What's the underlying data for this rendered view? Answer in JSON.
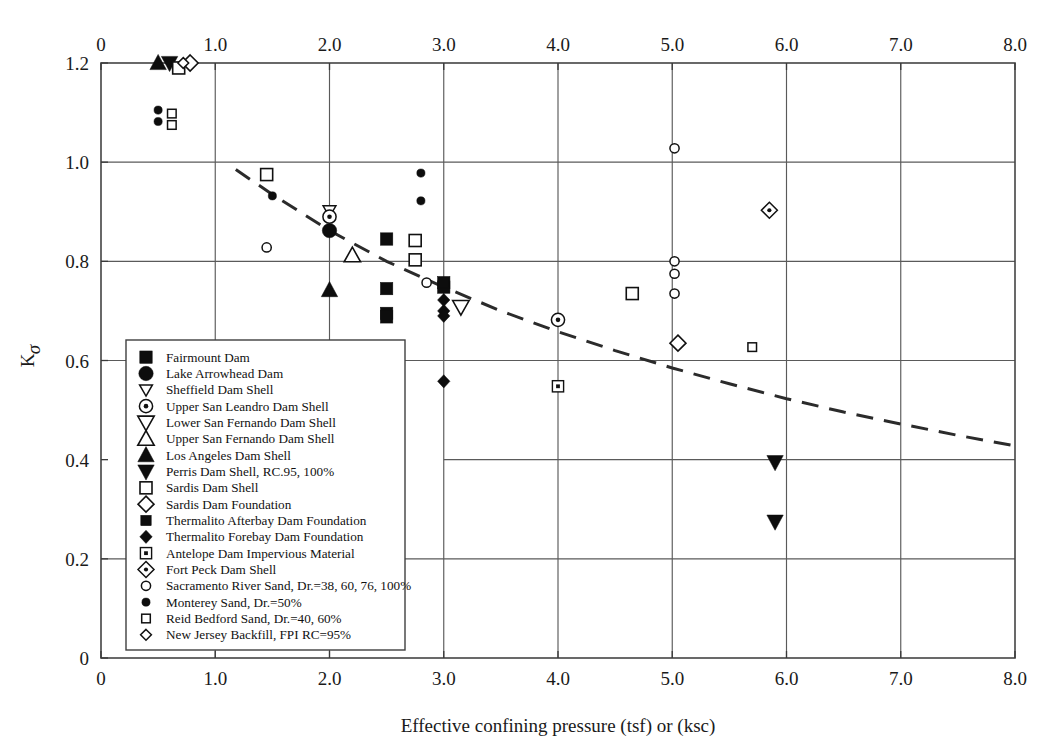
{
  "chart_data": {
    "type": "scatter",
    "title": "",
    "xlabel": "Effective confining pressure (tsf) or (ksc)",
    "ylabel": "Kσ",
    "ylabel_base": "K",
    "ylabel_sub": "σ",
    "xlim": [
      0,
      8.0
    ],
    "ylim": [
      0,
      1.2
    ],
    "xticks": [
      "0",
      "1.0",
      "2.0",
      "3.0",
      "4.0",
      "5.0",
      "6.0",
      "7.0",
      "8.0"
    ],
    "xtick_values": [
      0,
      1.0,
      2.0,
      3.0,
      4.0,
      5.0,
      6.0,
      7.0,
      8.0
    ],
    "yticks": [
      "0",
      "0.2",
      "0.4",
      "0.6",
      "0.8",
      "1.0",
      "1.2"
    ],
    "ytick_values": [
      0,
      0.2,
      0.4,
      0.6,
      0.8,
      1.0,
      1.2
    ],
    "grid": true,
    "top_axis": true,
    "legend_position": "lower-left-inside",
    "trendline": {
      "name": "Recommended K-sigma curve",
      "style": "dashed",
      "color": "#2b2b2b",
      "points": [
        [
          1.18,
          0.985
        ],
        [
          1.5,
          0.935
        ],
        [
          2.0,
          0.862
        ],
        [
          2.5,
          0.8
        ],
        [
          3.0,
          0.748
        ],
        [
          3.5,
          0.7
        ],
        [
          4.0,
          0.658
        ],
        [
          4.5,
          0.62
        ],
        [
          5.0,
          0.585
        ],
        [
          5.5,
          0.553
        ],
        [
          6.0,
          0.523
        ],
        [
          6.5,
          0.496
        ],
        [
          7.0,
          0.472
        ],
        [
          7.5,
          0.449
        ],
        [
          8.0,
          0.428
        ]
      ]
    },
    "series": [
      {
        "name": "Fairmount Dam",
        "marker": "filled-square",
        "points": [
          [
            2.5,
            0.845
          ],
          [
            2.5,
            0.745
          ],
          [
            2.5,
            0.695
          ],
          [
            2.5,
            0.688
          ],
          [
            3.0,
            0.757
          ],
          [
            3.0,
            0.748
          ]
        ]
      },
      {
        "name": "Lake Arrowhead Dam",
        "marker": "filled-circle",
        "points": [
          [
            2.0,
            0.862
          ]
        ]
      },
      {
        "name": "Sheffield Dam Shell",
        "marker": "open-triangle-down-small",
        "points": [
          [
            2.0,
            0.902
          ]
        ]
      },
      {
        "name": "Upper San Leandro Dam Shell",
        "marker": "dot-circle",
        "points": [
          [
            2.0,
            0.89
          ],
          [
            4.0,
            0.682
          ]
        ]
      },
      {
        "name": "Lower San Fernando Dam Shell",
        "marker": "open-triangle-down",
        "points": [
          [
            3.15,
            0.708
          ]
        ]
      },
      {
        "name": "Upper San Fernando Dam Shell",
        "marker": "open-triangle-up",
        "points": [
          [
            2.2,
            0.812
          ]
        ]
      },
      {
        "name": "Los Angeles Dam Shell",
        "marker": "filled-triangle-up",
        "points": [
          [
            0.5,
            1.2
          ],
          [
            2.0,
            0.742
          ]
        ]
      },
      {
        "name": "Perris Dam Shell, RC.95, 100%",
        "marker": "filled-triangle-down",
        "points": [
          [
            0.6,
            1.2
          ],
          [
            5.9,
            0.395
          ],
          [
            5.9,
            0.275
          ]
        ]
      },
      {
        "name": "Sardis Dam Shell",
        "marker": "open-square",
        "points": [
          [
            0.68,
            1.19
          ],
          [
            1.45,
            0.975
          ],
          [
            2.75,
            0.842
          ],
          [
            2.75,
            0.803
          ],
          [
            4.65,
            0.735
          ]
        ]
      },
      {
        "name": "Sardis Dam Foundation",
        "marker": "open-diamond",
        "points": [
          [
            0.78,
            1.2
          ],
          [
            5.05,
            0.635
          ]
        ]
      },
      {
        "name": "Thermalito Afterbay Dam Foundation",
        "marker": "filled-square-small",
        "points": [
          [
            3.0,
            0.757
          ]
        ]
      },
      {
        "name": "Thermalito Forebay Dam Foundation",
        "marker": "filled-diamond",
        "points": [
          [
            3.0,
            0.722
          ],
          [
            3.0,
            0.7
          ],
          [
            3.0,
            0.69
          ],
          [
            3.0,
            0.558
          ]
        ]
      },
      {
        "name": "Antelope Dam Impervious Material",
        "marker": "square-dot",
        "points": [
          [
            4.0,
            0.548
          ]
        ]
      },
      {
        "name": "Fort Peck Dam Shell",
        "marker": "diamond-dot",
        "points": [
          [
            5.85,
            0.903
          ]
        ]
      },
      {
        "name": "Sacramento River Sand, Dr.=38, 60, 76, 100%",
        "marker": "open-circle-small",
        "points": [
          [
            1.45,
            0.828
          ],
          [
            2.85,
            0.757
          ],
          [
            5.02,
            1.028
          ],
          [
            5.02,
            0.8
          ],
          [
            5.02,
            0.775
          ],
          [
            5.02,
            0.735
          ]
        ]
      },
      {
        "name": "Monterey Sand, Dr.=50%",
        "marker": "filled-circle-small",
        "points": [
          [
            0.5,
            1.105
          ],
          [
            0.5,
            1.082
          ],
          [
            1.5,
            0.932
          ],
          [
            2.8,
            0.978
          ],
          [
            2.8,
            0.922
          ]
        ]
      },
      {
        "name": "Reid Bedford Sand, Dr.=40, 60%",
        "marker": "open-square-small",
        "points": [
          [
            0.62,
            1.098
          ],
          [
            0.62,
            1.075
          ],
          [
            5.7,
            0.627
          ]
        ]
      },
      {
        "name": "New Jersey Backfill, FPI RC=95%",
        "marker": "open-diamond-small",
        "points": [
          [
            0.72,
            1.2
          ]
        ]
      }
    ],
    "legend": [
      {
        "label": "Fairmount Dam",
        "marker": "filled-square"
      },
      {
        "label": "Lake Arrowhead Dam",
        "marker": "filled-circle"
      },
      {
        "label": "Sheffield Dam Shell",
        "marker": "open-triangle-down-small"
      },
      {
        "label": "Upper San Leandro Dam Shell",
        "marker": "dot-circle"
      },
      {
        "label": "Lower San Fernando Dam Shell",
        "marker": "open-triangle-down"
      },
      {
        "label": "Upper San Fernando Dam Shell",
        "marker": "open-triangle-up"
      },
      {
        "label": "Los Angeles Dam Shell",
        "marker": "filled-triangle-up"
      },
      {
        "label": "Perris Dam Shell, RC.95, 100%",
        "marker": "filled-triangle-down"
      },
      {
        "label": "Sardis Dam Shell",
        "marker": "open-square"
      },
      {
        "label": "Sardis Dam Foundation",
        "marker": "open-diamond"
      },
      {
        "label": "Thermalito Afterbay Dam Foundation",
        "marker": "filled-square-small"
      },
      {
        "label": "Thermalito Forebay Dam Foundation",
        "marker": "filled-diamond"
      },
      {
        "label": "Antelope Dam Impervious Material",
        "marker": "square-dot"
      },
      {
        "label": "Fort Peck Dam Shell",
        "marker": "diamond-dot"
      },
      {
        "label": "Sacramento River Sand, Dr.=38, 60, 76, 100%",
        "marker": "open-circle-small"
      },
      {
        "label": "Monterey Sand, Dr.=50%",
        "marker": "filled-circle-small"
      },
      {
        "label": "Reid Bedford Sand, Dr.=40, 60%",
        "marker": "open-square-small"
      },
      {
        "label": "New Jersey Backfill, FPI RC=95%",
        "marker": "open-diamond-small"
      }
    ]
  }
}
